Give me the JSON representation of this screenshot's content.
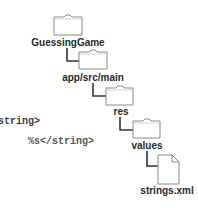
{
  "code_snippet": {
    "line1": "string>",
    "line2": "%s</string>"
  },
  "tree": {
    "nodes": [
      {
        "name": "GuessingGame",
        "icon": "folder-icon",
        "depth": 0
      },
      {
        "name": "app/src/main",
        "icon": "folder-icon",
        "depth": 1
      },
      {
        "name": "res",
        "icon": "folder-icon",
        "depth": 2
      },
      {
        "name": "values",
        "icon": "folder-icon",
        "depth": 3
      },
      {
        "name": "strings.xml",
        "icon": "file-icon",
        "depth": 4
      }
    ]
  },
  "colors": {
    "outline": "#8a8a8a",
    "connector": "#333333",
    "text": "#2a2a2a"
  }
}
